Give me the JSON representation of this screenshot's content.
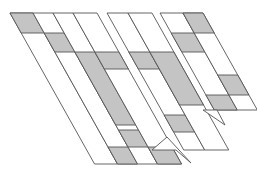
{
  "figure": {
    "width": 257,
    "height": 173,
    "background": "#ffffff",
    "stroke": "#555555",
    "fill_shaded": "#c4c4c4",
    "fill_plain": "#ffffff",
    "slope": 0.56
  },
  "strips": [
    {
      "group": "left",
      "x0": 10,
      "x1": 33,
      "y_top": 13,
      "y_bot": 164,
      "shaded": [
        [
          13,
          33
        ]
      ]
    },
    {
      "group": "left",
      "x0": 33,
      "x1": 53,
      "y_top": 13,
      "y_bot": 164,
      "shaded": [
        [
          33,
          52
        ],
        [
          147,
          164
        ]
      ]
    },
    {
      "group": "left",
      "x0": 53,
      "x1": 73,
      "y_top": 13,
      "y_bot": 164,
      "shaded": [
        [
          52,
          125
        ],
        [
          130,
          147
        ]
      ]
    },
    {
      "group": "left",
      "x0": 73,
      "x1": 97,
      "y_top": 13,
      "y_bot": 164,
      "shaded": [
        [
          52,
          69
        ],
        [
          147,
          164
        ]
      ]
    },
    {
      "group": "middle",
      "x0": 107,
      "x1": 128,
      "y_top": 13,
      "y_bot": 150,
      "shaded": [
        [
          52,
          69
        ],
        [
          115,
          132
        ]
      ]
    },
    {
      "group": "middle",
      "x0": 128,
      "x1": 152,
      "y_top": 13,
      "y_bot": 150,
      "shaded": [
        [
          52,
          105
        ]
      ]
    },
    {
      "group": "right",
      "x0": 160,
      "x1": 183,
      "y_top": 13,
      "y_bot": 110,
      "shaded": [
        [
          33,
          52
        ],
        [
          95,
          110
        ]
      ]
    },
    {
      "group": "right",
      "x0": 183,
      "x1": 203,
      "y_top": 13,
      "y_bot": 110,
      "shaded": [
        [
          13,
          33
        ],
        [
          75,
          95
        ]
      ]
    }
  ],
  "tips": [
    {
      "group": "middle",
      "points": [
        [
          152,
          150
        ],
        [
          176,
          150
        ],
        [
          191,
          163
        ],
        [
          167,
          137
        ]
      ]
    },
    {
      "group": "right",
      "points": [
        [
          203,
          110
        ],
        [
          217,
          110
        ],
        [
          225,
          125
        ]
      ]
    }
  ]
}
